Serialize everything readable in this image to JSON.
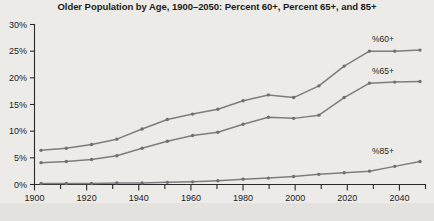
{
  "chart_data": {
    "type": "line",
    "title": "Older Population by Age, 1900–2050: Percent 60+, Percent 65+, and 85+",
    "xlabel": "",
    "ylabel": "",
    "xlim": [
      1900,
      2050
    ],
    "ylim": [
      0,
      30
    ],
    "grid": false,
    "legend_position": "inline-right",
    "x": [
      1900,
      1910,
      1920,
      1930,
      1940,
      1950,
      1960,
      1970,
      1980,
      1990,
      2000,
      2010,
      2020,
      2030,
      2040,
      2050
    ],
    "x_tick_labels": [
      "1900",
      "1920",
      "1940",
      "1960",
      "1980",
      "2000",
      "2020",
      "2040"
    ],
    "x_tick_values": [
      1900,
      1920,
      1940,
      1960,
      1980,
      2000,
      2020,
      2040
    ],
    "x_minor_tick_values": [
      1910,
      1930,
      1950,
      1970,
      1990,
      2010,
      2030,
      2050
    ],
    "y_tick_labels": [
      "0%",
      "5%",
      "10%",
      "15%",
      "20%",
      "25%",
      "30%"
    ],
    "y_tick_values": [
      0,
      5,
      10,
      15,
      20,
      25,
      30
    ],
    "series": [
      {
        "name": "%60+",
        "label": "%60+",
        "color": "#7d7d7d",
        "values": [
          6.4,
          6.8,
          7.5,
          8.5,
          10.4,
          12.2,
          13.2,
          14.1,
          15.7,
          16.8,
          16.3,
          18.5,
          22.2,
          25.0,
          25.0,
          25.2
        ]
      },
      {
        "name": "%65+",
        "label": "%65+",
        "color": "#7d7d7d",
        "values": [
          4.1,
          4.3,
          4.7,
          5.4,
          6.8,
          8.1,
          9.2,
          9.8,
          11.3,
          12.6,
          12.4,
          13.0,
          16.3,
          19.0,
          19.2,
          19.3
        ]
      },
      {
        "name": "%85+",
        "label": "%85+",
        "color": "#7d7d7d",
        "values": [
          0.2,
          0.2,
          0.2,
          0.3,
          0.3,
          0.4,
          0.5,
          0.7,
          1.0,
          1.2,
          1.5,
          1.9,
          2.2,
          2.5,
          3.4,
          4.3
        ]
      }
    ]
  },
  "colors": {
    "background": "#edebe7",
    "line": "#7d7d7d",
    "axis": "#2a2a2a",
    "text": "#1b1b1b"
  }
}
